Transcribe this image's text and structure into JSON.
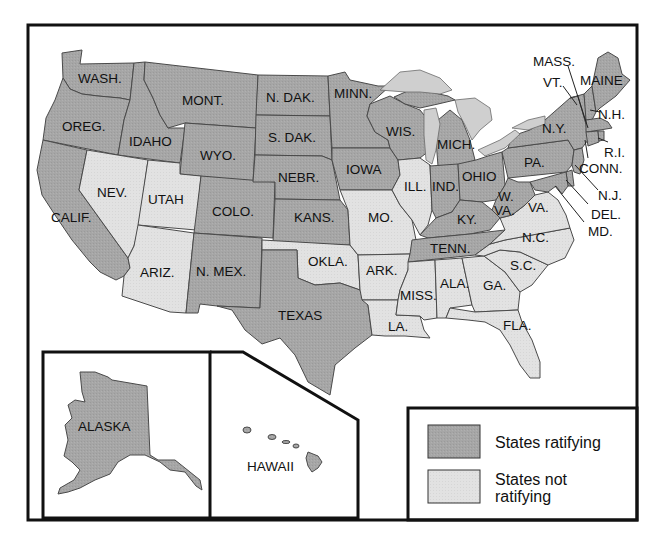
{
  "map": {
    "colors": {
      "ratifying": "#a6a6a6",
      "not_ratifying": "#e2e2e2",
      "lakes": "#cfcfcf",
      "frame": "#111111",
      "background": "#ffffff"
    },
    "states": [
      {
        "id": "wash",
        "label": "WASH.",
        "status": "ratifying"
      },
      {
        "id": "oreg",
        "label": "OREG.",
        "status": "ratifying"
      },
      {
        "id": "calif",
        "label": "CALIF.",
        "status": "ratifying"
      },
      {
        "id": "idaho",
        "label": "IDAHO",
        "status": "ratifying"
      },
      {
        "id": "nev",
        "label": "NEV.",
        "status": "not_ratifying"
      },
      {
        "id": "mont",
        "label": "MONT.",
        "status": "ratifying"
      },
      {
        "id": "wyo",
        "label": "WYO.",
        "status": "ratifying"
      },
      {
        "id": "utah",
        "label": "UTAH",
        "status": "not_ratifying"
      },
      {
        "id": "colo",
        "label": "COLO.",
        "status": "ratifying"
      },
      {
        "id": "ariz",
        "label": "ARIZ.",
        "status": "not_ratifying"
      },
      {
        "id": "nmex",
        "label": "N. MEX.",
        "status": "ratifying"
      },
      {
        "id": "ndak",
        "label": "N. DAK.",
        "status": "ratifying"
      },
      {
        "id": "sdak",
        "label": "S. DAK.",
        "status": "ratifying"
      },
      {
        "id": "nebr",
        "label": "NEBR.",
        "status": "ratifying"
      },
      {
        "id": "kans",
        "label": "KANS.",
        "status": "ratifying"
      },
      {
        "id": "okla",
        "label": "OKLA.",
        "status": "not_ratifying"
      },
      {
        "id": "texas",
        "label": "TEXAS",
        "status": "ratifying"
      },
      {
        "id": "minn",
        "label": "MINN.",
        "status": "ratifying"
      },
      {
        "id": "iowa",
        "label": "IOWA",
        "status": "ratifying"
      },
      {
        "id": "mo",
        "label": "MO.",
        "status": "not_ratifying"
      },
      {
        "id": "ark",
        "label": "ARK.",
        "status": "not_ratifying"
      },
      {
        "id": "la",
        "label": "LA.",
        "status": "not_ratifying"
      },
      {
        "id": "wis",
        "label": "WIS.",
        "status": "ratifying"
      },
      {
        "id": "ill",
        "label": "ILL.",
        "status": "not_ratifying"
      },
      {
        "id": "mich",
        "label": "MICH.",
        "status": "ratifying"
      },
      {
        "id": "ind",
        "label": "IND.",
        "status": "ratifying"
      },
      {
        "id": "ohio",
        "label": "OHIO",
        "status": "ratifying"
      },
      {
        "id": "ky",
        "label": "KY.",
        "status": "ratifying"
      },
      {
        "id": "tenn",
        "label": "TENN.",
        "status": "ratifying"
      },
      {
        "id": "miss",
        "label": "MISS.",
        "status": "not_ratifying"
      },
      {
        "id": "ala",
        "label": "ALA.",
        "status": "not_ratifying"
      },
      {
        "id": "ga",
        "label": "GA.",
        "status": "not_ratifying"
      },
      {
        "id": "fla",
        "label": "FLA.",
        "status": "not_ratifying"
      },
      {
        "id": "sc",
        "label": "S.C.",
        "status": "not_ratifying"
      },
      {
        "id": "nc",
        "label": "N.C.",
        "status": "not_ratifying"
      },
      {
        "id": "va",
        "label": "VA.",
        "status": "not_ratifying"
      },
      {
        "id": "wva",
        "label": "W. VA.",
        "status": "ratifying"
      },
      {
        "id": "pa",
        "label": "PA.",
        "status": "ratifying"
      },
      {
        "id": "ny",
        "label": "N.Y.",
        "status": "ratifying"
      },
      {
        "id": "vt",
        "label": "VT.",
        "status": "ratifying"
      },
      {
        "id": "nh",
        "label": "N.H.",
        "status": "ratifying"
      },
      {
        "id": "maine",
        "label": "MAINE",
        "status": "ratifying"
      },
      {
        "id": "mass",
        "label": "MASS.",
        "status": "ratifying"
      },
      {
        "id": "ri",
        "label": "R.I.",
        "status": "ratifying"
      },
      {
        "id": "conn",
        "label": "CONN.",
        "status": "ratifying"
      },
      {
        "id": "nj",
        "label": "N.J.",
        "status": "ratifying"
      },
      {
        "id": "del",
        "label": "DEL.",
        "status": "ratifying"
      },
      {
        "id": "md",
        "label": "MD.",
        "status": "ratifying"
      },
      {
        "id": "alaska",
        "label": "ALASKA",
        "status": "ratifying"
      },
      {
        "id": "hawaii",
        "label": "HAWAII",
        "status": "ratifying"
      }
    ],
    "insets": {
      "alaska_label": "ALASKA",
      "hawaii_label": "HAWAII"
    },
    "legend": {
      "items": [
        {
          "label": "States ratifying",
          "status": "ratifying"
        },
        {
          "label_line1": "States not",
          "label_line2": "ratifying",
          "status": "not_ratifying"
        }
      ]
    }
  }
}
